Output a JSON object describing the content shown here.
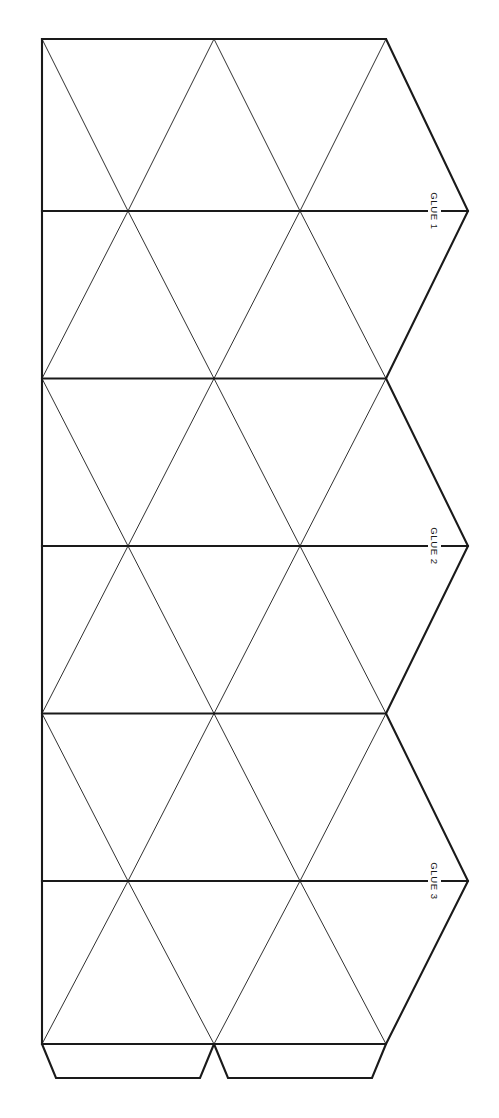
{
  "document": {
    "title": "Icosahedron Papercraft Net",
    "background_color": "#ffffff",
    "line_color": "#1a1a1a",
    "width": 499,
    "height": 1118
  },
  "net": {
    "description": "Flat foldable net of 20 equilateral triangles arranged in three horizontal strips, with glue tabs",
    "triangle_count": 20,
    "columns": 2,
    "bands": 6,
    "left_edge_x": 42,
    "right_edge_x": 386,
    "top_edge_y": 39,
    "bottom_edge_y": 1044,
    "column_xs": [
      42,
      214,
      386
    ],
    "band_ys": [
      39,
      211,
      378.5,
      546,
      713.5,
      881,
      1044
    ],
    "fold_line_color": "#1a1a1a",
    "cut_line_color": "#1a1a1a",
    "cut_line_width": 2.0,
    "fold_line_width": 0.9
  },
  "glue_tabs": {
    "side": [
      {
        "id": "glue-1",
        "label": "GLUE 1",
        "anchor_x": 386,
        "anchor_y": 211,
        "tip_x": 468,
        "label_x": 434,
        "label_y": 211
      },
      {
        "id": "glue-2",
        "label": "GLUE 2",
        "anchor_x": 386,
        "anchor_y": 546,
        "tip_x": 468,
        "label_x": 434,
        "label_y": 546
      },
      {
        "id": "glue-3",
        "label": "GLUE 3",
        "anchor_x": 386,
        "anchor_y": 881,
        "tip_x": 468,
        "label_x": 434,
        "label_y": 881
      }
    ],
    "bottom": [
      {
        "id": "bottom-tab-left",
        "x_start": 42,
        "x_end": 214,
        "y_top": 1044,
        "y_bottom": 1078,
        "inset": 14
      },
      {
        "id": "bottom-tab-right",
        "x_start": 214,
        "x_end": 386,
        "y_top": 1044,
        "y_bottom": 1078,
        "inset": 14
      }
    ]
  }
}
